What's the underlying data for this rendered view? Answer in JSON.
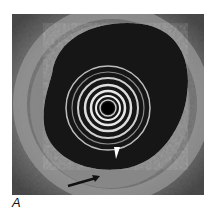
{
  "figure": {
    "panel_label": "A",
    "annotations": [
      {
        "type": "arrowhead",
        "color": "#ffffff",
        "direction": "down"
      },
      {
        "type": "arrow",
        "color": "#111111",
        "direction": "up-right"
      }
    ]
  }
}
